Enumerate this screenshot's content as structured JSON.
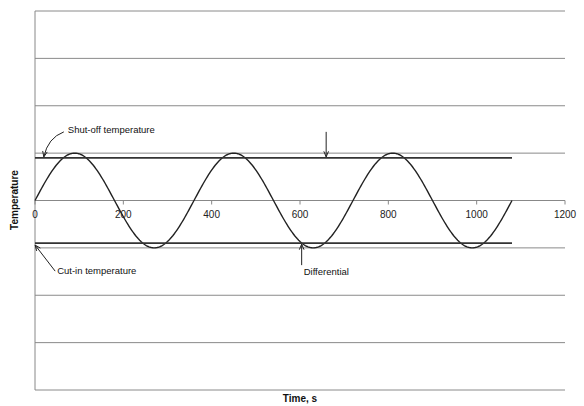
{
  "chart_data": {
    "type": "line",
    "title": "",
    "xlabel": "Time, s",
    "ylabel": "Temperature",
    "xlim": [
      0,
      1200
    ],
    "ylim": [
      -4,
      4
    ],
    "x_ticks": [
      0,
      200,
      400,
      600,
      800,
      1000,
      1200
    ],
    "x_tick_labels": [
      "0",
      "200",
      "400",
      "600",
      "800",
      "1000",
      "1200"
    ],
    "y_gridlines": [
      -4,
      -3,
      -2,
      -1,
      0,
      1,
      2,
      3,
      4
    ],
    "grid": true,
    "legend": "none",
    "series": [
      {
        "name": "Temperature",
        "kind": "sine",
        "amplitude": 1,
        "period": 360,
        "x_start": 0,
        "x_end": 1080,
        "color": "#222222"
      },
      {
        "name": "Shut-off temperature",
        "kind": "hline",
        "y": 0.9,
        "x_start": 0,
        "x_end": 1080,
        "color": "#333333"
      },
      {
        "name": "Cut-in temperature",
        "kind": "hline",
        "y": -0.9,
        "x_start": 0,
        "x_end": 1080,
        "color": "#333333"
      }
    ],
    "annotations": [
      {
        "text": "Shut-off temperature",
        "target_x": 20,
        "target_y": 0.9
      },
      {
        "text": "Cut-in temperature",
        "target_x": 100,
        "target_y": -0.9
      },
      {
        "text": "Differential",
        "target_x": 520,
        "target_y": -0.9
      },
      {
        "text": "",
        "target_x": 580,
        "target_y": 0.9,
        "arrow_only": true
      }
    ]
  }
}
